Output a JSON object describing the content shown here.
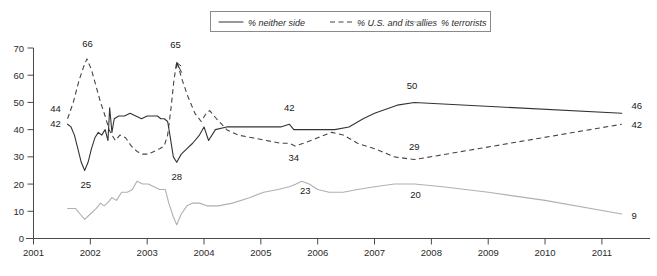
{
  "chart_data": {
    "type": "line",
    "title": "",
    "xlabel": "",
    "ylabel": "",
    "xlim": [
      2001,
      2011.6
    ],
    "ylim": [
      0,
      70
    ],
    "grid": false,
    "legend_position": "top-center",
    "y_ticks": [
      "0",
      "10",
      "20",
      "30",
      "40",
      "50",
      "60",
      "70"
    ],
    "x_ticks": [
      "2001",
      "2002",
      "2003",
      "2004",
      "2005",
      "2006",
      "2007",
      "2008",
      "2009",
      "2010",
      "2011"
    ],
    "series": [
      {
        "name": "% neither side",
        "style": "solid",
        "color": "#333333",
        "labeled_values": [
          42,
          25,
          28,
          42,
          50,
          46
        ],
        "points": [
          [
            2001.6,
            42
          ],
          [
            2001.66,
            41
          ],
          [
            2001.72,
            38
          ],
          [
            2001.78,
            33
          ],
          [
            2001.84,
            28
          ],
          [
            2001.9,
            25
          ],
          [
            2001.96,
            28
          ],
          [
            2002.02,
            33
          ],
          [
            2002.08,
            37
          ],
          [
            2002.14,
            39
          ],
          [
            2002.2,
            38
          ],
          [
            2002.26,
            40
          ],
          [
            2002.31,
            36
          ],
          [
            2002.34,
            48
          ],
          [
            2002.38,
            39
          ],
          [
            2002.42,
            44
          ],
          [
            2002.5,
            45
          ],
          [
            2002.6,
            45
          ],
          [
            2002.7,
            46
          ],
          [
            2002.8,
            45
          ],
          [
            2002.9,
            44
          ],
          [
            2003.0,
            45
          ],
          [
            2003.1,
            45
          ],
          [
            2003.18,
            45
          ],
          [
            2003.24,
            44
          ],
          [
            2003.3,
            44
          ],
          [
            2003.36,
            43
          ],
          [
            2003.4,
            38
          ],
          [
            2003.46,
            30
          ],
          [
            2003.52,
            28
          ],
          [
            2003.6,
            31
          ],
          [
            2003.7,
            33
          ],
          [
            2003.8,
            35
          ],
          [
            2003.92,
            38
          ],
          [
            2004.0,
            41
          ],
          [
            2004.08,
            36
          ],
          [
            2004.2,
            40
          ],
          [
            2004.4,
            41
          ],
          [
            2004.6,
            41
          ],
          [
            2004.9,
            41
          ],
          [
            2005.1,
            41
          ],
          [
            2005.35,
            41
          ],
          [
            2005.5,
            42
          ],
          [
            2005.58,
            40
          ],
          [
            2005.75,
            40
          ],
          [
            2006.0,
            40
          ],
          [
            2006.3,
            40
          ],
          [
            2006.55,
            41
          ],
          [
            2006.8,
            44
          ],
          [
            2007.0,
            46
          ],
          [
            2007.4,
            49
          ],
          [
            2007.7,
            50
          ],
          [
            2011.35,
            46
          ]
        ]
      },
      {
        "name": "% U.S. and its allies",
        "style": "dashed",
        "color": "#444444",
        "labeled_values": [
          44,
          66,
          65,
          34,
          29,
          42
        ],
        "points": [
          [
            2001.6,
            44
          ],
          [
            2001.7,
            50
          ],
          [
            2001.8,
            58
          ],
          [
            2001.88,
            63
          ],
          [
            2001.94,
            66
          ],
          [
            2002.02,
            62
          ],
          [
            2002.1,
            56
          ],
          [
            2002.18,
            50
          ],
          [
            2002.26,
            45
          ],
          [
            2002.33,
            40
          ],
          [
            2002.38,
            38
          ],
          [
            2002.44,
            36
          ],
          [
            2002.52,
            38
          ],
          [
            2002.62,
            37
          ],
          [
            2002.72,
            34
          ],
          [
            2002.82,
            32
          ],
          [
            2002.92,
            31
          ],
          [
            2003.02,
            31
          ],
          [
            2003.12,
            32
          ],
          [
            2003.22,
            33
          ],
          [
            2003.3,
            34
          ],
          [
            2003.36,
            38
          ],
          [
            2003.42,
            48
          ],
          [
            2003.47,
            58
          ],
          [
            2003.52,
            65
          ],
          [
            2003.62,
            58
          ],
          [
            2003.72,
            52
          ],
          [
            2003.84,
            46
          ],
          [
            2003.95,
            43
          ],
          [
            2004.04,
            46
          ],
          [
            2004.1,
            47
          ],
          [
            2004.22,
            44
          ],
          [
            2004.4,
            40
          ],
          [
            2004.6,
            38
          ],
          [
            2004.85,
            37
          ],
          [
            2005.1,
            36
          ],
          [
            2005.35,
            35
          ],
          [
            2005.5,
            35
          ],
          [
            2005.6,
            34
          ],
          [
            2005.75,
            35
          ],
          [
            2006.0,
            37
          ],
          [
            2006.25,
            39
          ],
          [
            2006.45,
            38
          ],
          [
            2006.7,
            35
          ],
          [
            2007.0,
            33
          ],
          [
            2007.35,
            30
          ],
          [
            2007.7,
            29
          ],
          [
            2011.35,
            42
          ]
        ]
      },
      {
        "name": "% terrorists",
        "style": "solid-light",
        "color": "#b0b0b0",
        "labeled_values": [
          11,
          7,
          5,
          23,
          20,
          9
        ],
        "points": [
          [
            2001.6,
            11
          ],
          [
            2001.74,
            11
          ],
          [
            2001.82,
            9
          ],
          [
            2001.9,
            7
          ],
          [
            2002.0,
            9
          ],
          [
            2002.1,
            11
          ],
          [
            2002.18,
            13
          ],
          [
            2002.24,
            12
          ],
          [
            2002.3,
            13
          ],
          [
            2002.38,
            15
          ],
          [
            2002.46,
            14
          ],
          [
            2002.55,
            17
          ],
          [
            2002.65,
            17
          ],
          [
            2002.74,
            18
          ],
          [
            2002.82,
            21
          ],
          [
            2002.92,
            20
          ],
          [
            2003.02,
            20
          ],
          [
            2003.12,
            19
          ],
          [
            2003.22,
            18
          ],
          [
            2003.32,
            18
          ],
          [
            2003.38,
            13
          ],
          [
            2003.46,
            8
          ],
          [
            2003.52,
            5
          ],
          [
            2003.6,
            9
          ],
          [
            2003.7,
            12
          ],
          [
            2003.8,
            13
          ],
          [
            2003.92,
            13
          ],
          [
            2004.05,
            12
          ],
          [
            2004.25,
            12
          ],
          [
            2004.5,
            13
          ],
          [
            2004.8,
            15
          ],
          [
            2005.05,
            17
          ],
          [
            2005.3,
            18
          ],
          [
            2005.5,
            19
          ],
          [
            2005.62,
            20
          ],
          [
            2005.72,
            21
          ],
          [
            2005.85,
            20
          ],
          [
            2006.0,
            18
          ],
          [
            2006.2,
            17
          ],
          [
            2006.45,
            17
          ],
          [
            2006.7,
            18
          ],
          [
            2007.0,
            19
          ],
          [
            2007.35,
            20
          ],
          [
            2007.7,
            20
          ],
          [
            2008.2,
            19
          ],
          [
            2009.0,
            17
          ],
          [
            2010.0,
            14
          ],
          [
            2011.35,
            9
          ]
        ]
      }
    ],
    "annotations": [
      {
        "text": "44",
        "x": 2001.48,
        "y": 46.5,
        "anchor": "end"
      },
      {
        "text": "42",
        "x": 2001.48,
        "y": 41.0,
        "anchor": "end"
      },
      {
        "text": "66",
        "x": 2001.95,
        "y": 70.5,
        "anchor": "middle"
      },
      {
        "text": "25",
        "x": 2001.92,
        "y": 18.5,
        "anchor": "middle"
      },
      {
        "text": "65",
        "x": 2003.5,
        "y": 70.0,
        "anchor": "middle"
      },
      {
        "text": "28",
        "x": 2003.52,
        "y": 21.5,
        "anchor": "middle"
      },
      {
        "text": "42",
        "x": 2005.5,
        "y": 47.0,
        "anchor": "middle"
      },
      {
        "text": "34",
        "x": 2005.58,
        "y": 28.5,
        "anchor": "middle"
      },
      {
        "text": "23",
        "x": 2005.78,
        "y": 16.5,
        "anchor": "middle"
      },
      {
        "text": "50",
        "x": 2007.66,
        "y": 55.0,
        "anchor": "middle"
      },
      {
        "text": "29",
        "x": 2007.7,
        "y": 32.5,
        "anchor": "middle"
      },
      {
        "text": "20",
        "x": 2007.72,
        "y": 15.0,
        "anchor": "middle"
      },
      {
        "text": "46",
        "x": 2011.52,
        "y": 47.5,
        "anchor": "start"
      },
      {
        "text": "42",
        "x": 2011.52,
        "y": 40.5,
        "anchor": "start"
      },
      {
        "text": "9",
        "x": 2011.52,
        "y": 7.0,
        "anchor": "start"
      }
    ]
  },
  "legend": {
    "items": [
      {
        "label": "% neither side",
        "style": "solid"
      },
      {
        "label": "% U.S. and its allies",
        "style": "dashed"
      },
      {
        "label": "% terrorists",
        "style": "solid-light"
      }
    ]
  }
}
